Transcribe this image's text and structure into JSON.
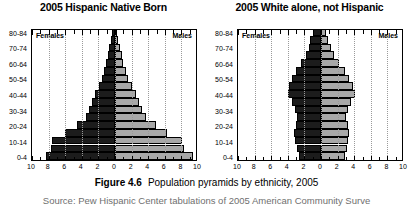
{
  "figure": {
    "number_label": "Figure 4.6",
    "caption": "Population pyramids by ethnicity, 2005",
    "source": "Source: Pew Hispanic Center tabulations of 2005 American Community Surve"
  },
  "chart_data": [
    {
      "type": "bar",
      "orientation": "population-pyramid",
      "title": "2005 Hispanic Native Born",
      "xlabel": "",
      "ylabel": "",
      "xlim": [
        -10,
        10
      ],
      "xticks": [
        -10,
        -8,
        -6,
        -4,
        -2,
        0,
        2,
        4,
        6,
        8,
        10
      ],
      "xticklabels": [
        "10",
        "8",
        "6",
        "4",
        "2",
        "0",
        "2",
        "4",
        "6",
        "8",
        "10"
      ],
      "grid": true,
      "grid_axis": "x",
      "legend": [
        "Females",
        "Males"
      ],
      "legend_position": "inside-top-corners",
      "categories": [
        "0-4",
        "5-9",
        "10-14",
        "15-19",
        "20-24",
        "25-29",
        "30-34",
        "35-39",
        "40-44",
        "45-49",
        "50-54",
        "55-59",
        "60-64",
        "65-69",
        "70-74",
        "75-79",
        "80-84"
      ],
      "visible_yticklabels": [
        "0-4",
        "10-14",
        "20-24",
        "30-34",
        "40-44",
        "50-54",
        "60-64",
        "70-74",
        "80-84"
      ],
      "series": [
        {
          "name": "Females",
          "side": "left",
          "color": "#1c1c1c",
          "values": [
            8.3,
            7.7,
            7.6,
            6.0,
            4.6,
            3.5,
            3.1,
            2.8,
            2.4,
            1.9,
            1.6,
            1.3,
            1.1,
            0.9,
            0.7,
            0.5,
            0.4
          ]
        },
        {
          "name": "Males",
          "side": "right",
          "color": "#a8a8a8",
          "values": [
            9.4,
            8.3,
            8.1,
            6.3,
            4.9,
            3.7,
            3.2,
            2.9,
            2.5,
            2.0,
            1.6,
            1.3,
            1.0,
            0.8,
            0.6,
            0.4,
            0.3
          ]
        }
      ]
    },
    {
      "type": "bar",
      "orientation": "population-pyramid",
      "title": "2005 White alone, not Hispanic",
      "xlabel": "",
      "ylabel": "",
      "xlim": [
        -10,
        10
      ],
      "xticks": [
        -10,
        -8,
        -6,
        -4,
        -2,
        0,
        2,
        4,
        6,
        8,
        10
      ],
      "xticklabels": [
        "10",
        "8",
        "6",
        "4",
        "2",
        "0",
        "2",
        "4",
        "6",
        "8",
        "10"
      ],
      "grid": true,
      "grid_axis": "x",
      "legend": [
        "Females",
        "Males"
      ],
      "legend_position": "inside-top-corners",
      "categories": [
        "0-4",
        "5-9",
        "10-14",
        "15-19",
        "20-24",
        "25-29",
        "30-34",
        "35-39",
        "40-44",
        "45-49",
        "50-54",
        "55-59",
        "60-64",
        "65-69",
        "70-74",
        "75-79",
        "80-84"
      ],
      "visible_yticklabels": [
        "0-4",
        "10-14",
        "20-24",
        "30-34",
        "40-44",
        "50-54",
        "60-64",
        "70-74",
        "80-84"
      ],
      "series": [
        {
          "name": "Females",
          "side": "left",
          "color": "#1c1c1c",
          "values": [
            2.7,
            2.9,
            3.1,
            3.2,
            3.0,
            2.9,
            3.1,
            3.5,
            4.0,
            3.9,
            3.5,
            3.0,
            2.4,
            1.8,
            1.5,
            1.3,
            1.0
          ]
        },
        {
          "name": "Males",
          "side": "right",
          "color": "#a8a8a8",
          "values": [
            2.9,
            3.1,
            3.3,
            3.4,
            3.2,
            3.0,
            3.2,
            3.6,
            4.1,
            3.9,
            3.4,
            2.9,
            2.2,
            1.6,
            1.2,
            0.9,
            0.6
          ]
        }
      ]
    }
  ]
}
